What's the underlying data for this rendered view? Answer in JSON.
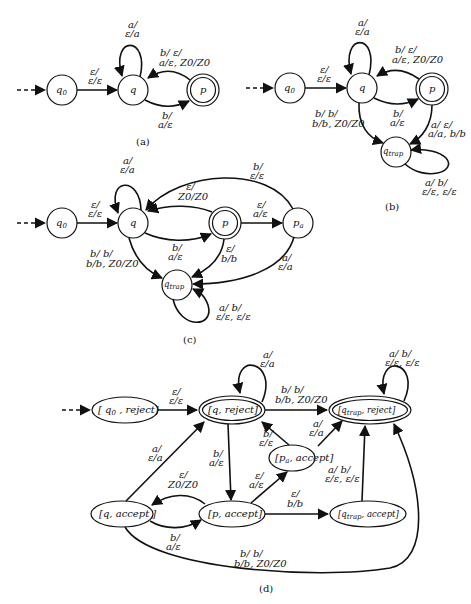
{
  "figure": {
    "panels": [
      {
        "id": "a",
        "caption": "(a)",
        "states": [
          {
            "id": "q0",
            "label": "q",
            "sub": "0",
            "start": true,
            "accepting": false
          },
          {
            "id": "q",
            "label": "q",
            "sub": "",
            "start": false,
            "accepting": false
          },
          {
            "id": "p",
            "label": "p",
            "sub": "",
            "start": false,
            "accepting": true
          }
        ],
        "transitions": [
          {
            "from": "q0",
            "to": "q",
            "label": [
              "ε/",
              "ε/ε"
            ]
          },
          {
            "from": "q",
            "to": "q",
            "label": [
              "a/",
              "ε/a"
            ]
          },
          {
            "from": "q",
            "to": "p",
            "label": [
              "b/",
              "a/ε"
            ]
          },
          {
            "from": "p",
            "to": "q",
            "label": [
              "b/      ε/",
              "a/ε, Z0/Z0"
            ]
          }
        ]
      },
      {
        "id": "b",
        "caption": "(b)",
        "states": [
          {
            "id": "q0",
            "label": "q",
            "sub": "0",
            "start": true,
            "accepting": false
          },
          {
            "id": "q",
            "label": "q",
            "sub": "",
            "start": false,
            "accepting": false
          },
          {
            "id": "p",
            "label": "p",
            "sub": "",
            "start": false,
            "accepting": true
          },
          {
            "id": "qtrap",
            "label": "q",
            "sub": "trap",
            "start": false,
            "accepting": false
          }
        ],
        "transitions": [
          {
            "from": "q0",
            "to": "q",
            "label": [
              "ε/",
              "ε/ε"
            ]
          },
          {
            "from": "q",
            "to": "q",
            "label": [
              "a/",
              "ε/a"
            ]
          },
          {
            "from": "q",
            "to": "p",
            "label": [
              "b/",
              "a/ε"
            ]
          },
          {
            "from": "p",
            "to": "q",
            "label": [
              "b/      ε/",
              "a/ε, Z0/Z0"
            ]
          },
          {
            "from": "q",
            "to": "qtrap",
            "label": [
              "b/      b/",
              "b/b, Z0/Z0"
            ]
          },
          {
            "from": "p",
            "to": "qtrap",
            "label": [
              "a/     ε/",
              "a/a, b/b"
            ]
          },
          {
            "from": "qtrap",
            "to": "qtrap",
            "label": [
              "a/     b/",
              "ε/ε, ε/ε"
            ]
          }
        ]
      },
      {
        "id": "c",
        "caption": "(c)",
        "states": [
          {
            "id": "q0",
            "label": "q",
            "sub": "0",
            "start": true,
            "accepting": false
          },
          {
            "id": "q",
            "label": "q",
            "sub": "",
            "start": false,
            "accepting": false
          },
          {
            "id": "p",
            "label": "p",
            "sub": "",
            "start": false,
            "accepting": true
          },
          {
            "id": "pa",
            "label": "p",
            "sub": "a",
            "start": false,
            "accepting": false
          },
          {
            "id": "qtrap",
            "label": "q",
            "sub": "trap",
            "start": false,
            "accepting": false
          }
        ],
        "transitions": [
          {
            "from": "q0",
            "to": "q",
            "label": [
              "ε/",
              "ε/ε"
            ]
          },
          {
            "from": "q",
            "to": "q",
            "label": [
              "a/",
              "ε/a"
            ]
          },
          {
            "from": "q",
            "to": "p",
            "label": [
              "b/",
              "a/ε"
            ]
          },
          {
            "from": "p",
            "to": "q",
            "label": [
              "ε/",
              "Z0/Z0"
            ]
          },
          {
            "from": "p",
            "to": "pa",
            "label": [
              "ε/",
              "a/ε"
            ]
          },
          {
            "from": "pa",
            "to": "q",
            "label": [
              "b/",
              "ε/ε"
            ]
          },
          {
            "from": "pa",
            "to": "qtrap",
            "label": [
              "a/",
              "ε/a"
            ]
          },
          {
            "from": "p",
            "to": "qtrap",
            "label": [
              "ε/",
              "b/b"
            ]
          },
          {
            "from": "q",
            "to": "qtrap",
            "label": [
              "b/      b/",
              "b/b, Z0/Z0"
            ]
          },
          {
            "from": "qtrap",
            "to": "qtrap",
            "label": [
              "a/     b/",
              "ε/ε, ε/ε"
            ]
          }
        ]
      },
      {
        "id": "d",
        "caption": "(d)",
        "states": [
          {
            "id": "q0_reject",
            "label": "q",
            "sub": "0",
            "tag": "reject",
            "start": true,
            "accepting": false
          },
          {
            "id": "q_reject",
            "label": "q",
            "sub": "",
            "tag": "reject",
            "start": false,
            "accepting": true
          },
          {
            "id": "qtrap_reject",
            "label": "q",
            "sub": "trap",
            "tag": "reject",
            "start": false,
            "accepting": true
          },
          {
            "id": "pa_accept",
            "label": "p",
            "sub": "a",
            "tag": "accept",
            "start": false,
            "accepting": false
          },
          {
            "id": "q_accept",
            "label": "q",
            "sub": "",
            "tag": "accept",
            "start": false,
            "accepting": false
          },
          {
            "id": "p_accept",
            "label": "p",
            "sub": "",
            "tag": "accept",
            "start": false,
            "accepting": false
          },
          {
            "id": "qtrap_accept",
            "label": "q",
            "sub": "trap",
            "tag": "accept",
            "start": false,
            "accepting": false
          }
        ],
        "transitions": [
          {
            "from": "q0_reject",
            "to": "q_reject",
            "label": [
              "ε/",
              "ε/ε"
            ]
          },
          {
            "from": "q_reject",
            "to": "q_reject",
            "label": [
              "a/",
              "ε/a"
            ]
          },
          {
            "from": "q_reject",
            "to": "qtrap_reject",
            "label": [
              "b/      b/",
              "b/b, Z0/Z0"
            ]
          },
          {
            "from": "qtrap_reject",
            "to": "qtrap_reject",
            "label": [
              "a/     b/",
              "ε/ε, ε/ε"
            ]
          },
          {
            "from": "q_reject",
            "to": "p_accept",
            "label": [
              "b/",
              "a/ε"
            ]
          },
          {
            "from": "pa_accept",
            "to": "q_reject",
            "label": [
              "b/",
              "ε/ε"
            ]
          },
          {
            "from": "pa_accept",
            "to": "qtrap_reject",
            "label": [
              "a/",
              "ε/a"
            ]
          },
          {
            "from": "q_accept",
            "to": "q_reject",
            "label": [
              "a/",
              "ε/a"
            ]
          },
          {
            "from": "p_accept",
            "to": "q_accept",
            "label": [
              "ε/",
              "Z0/Z0"
            ]
          },
          {
            "from": "q_accept",
            "to": "p_accept",
            "label": [
              "b/",
              "a/ε"
            ]
          },
          {
            "from": "p_accept",
            "to": "pa_accept",
            "label": [
              "ε/",
              "a/ε"
            ]
          },
          {
            "from": "p_accept",
            "to": "qtrap_accept",
            "label": [
              "ε/",
              "b/b"
            ]
          },
          {
            "from": "qtrap_accept",
            "to": "qtrap_reject",
            "label": [
              "a/     b/",
              "ε/ε, ε/ε"
            ]
          },
          {
            "from": "q_accept",
            "to": "qtrap_reject",
            "label": [
              "b/      b/",
              "b/b, Z0/Z0"
            ]
          }
        ]
      }
    ],
    "text": {
      "cap_a": "(a)",
      "cap_b": "(b)",
      "cap_c": "(c)",
      "cap_d": "(d)",
      "q": "q",
      "p": "p",
      "sub0": "0",
      "subtrap": "trap",
      "suba": "a",
      "reject": "reject",
      "accept": "accept",
      "lb_eps_top": "ε/",
      "lb_eps_eps": "ε/ε",
      "lb_a_top": "a/",
      "lb_eps_a": "ε/a",
      "lb_b_top": "b/",
      "lb_a_eps": "a/ε",
      "lb_b_eps_top": "b/      ε/",
      "lb_aeps_z0z0": "a/ε, Z0/Z0",
      "lb_bb_top": "b/      b/",
      "lb_bb_z0z0": "b/b, Z0/Z0",
      "lb_a_e_top": "a/     ε/",
      "lb_aa_bb": "a/a, b/b",
      "lb_a_b_top": "a/     b/",
      "lb_ee_ee": "ε/ε, ε/ε",
      "lb_z0z0": "Z0/Z0",
      "lb_bb": "b/b",
      "lb_eps_eps2": "ε/ε"
    }
  }
}
